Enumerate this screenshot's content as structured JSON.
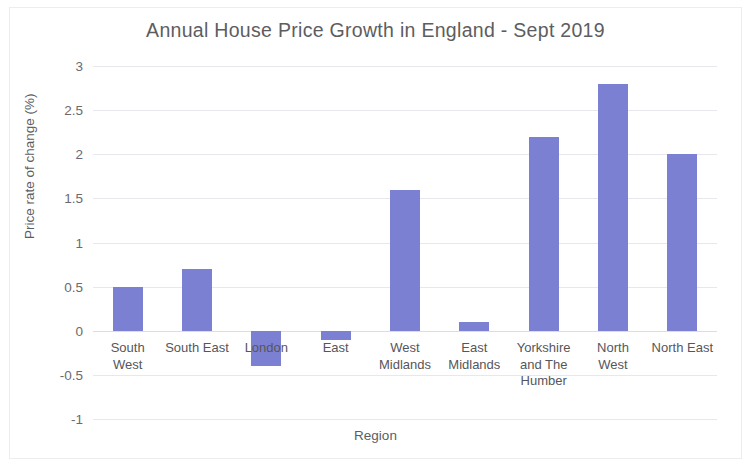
{
  "chart_data": {
    "type": "bar",
    "title": "Annual House Price Growth in England - Sept 2019",
    "xlabel": "Region",
    "ylabel": "Price rate of change (%)",
    "categories": [
      "South\nWest",
      "South East",
      "London",
      "East",
      "West\nMidlands",
      "East\nMidlands",
      "Yorkshire\nand The\nHumber",
      "North\nWest",
      "North East"
    ],
    "values": [
      0.5,
      0.7,
      -0.4,
      -0.1,
      1.6,
      0.1,
      2.2,
      2.8,
      2.0
    ],
    "ylim": [
      -1,
      3
    ],
    "ytick_labels": [
      "3",
      "2.5",
      "2",
      "1.5",
      "1",
      "0.5",
      "0",
      "-0.5",
      "-1"
    ],
    "ytick_values": [
      3,
      2.5,
      2,
      1.5,
      1,
      0.5,
      0,
      -0.5,
      -1
    ],
    "grid": true,
    "legend": false,
    "bar_color": "#7b80d2",
    "gridline_color": "#e8e8ec"
  }
}
